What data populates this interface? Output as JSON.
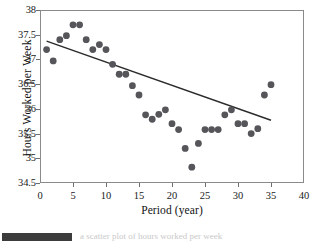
{
  "figure": {
    "caption_bar_label": "",
    "caption_text": "a scatter plot of hours worked per week"
  },
  "chart_data": {
    "type": "scatter",
    "title": "",
    "xlabel": "Period (year)",
    "ylabel": "Hours Worked per Week",
    "xlim": [
      0,
      40
    ],
    "ylim": [
      34.5,
      38
    ],
    "xticks": [
      0,
      5,
      10,
      15,
      20,
      25,
      30,
      35,
      40
    ],
    "xtick_labels": [
      "0",
      "5",
      "10",
      "15",
      "20",
      "25",
      "30",
      "35",
      "40"
    ],
    "yticks": [
      34.5,
      35,
      35.5,
      36,
      36.5,
      37,
      37.5,
      38
    ],
    "ytick_labels": [
      "34.5",
      "35",
      "35.5",
      "36",
      "36.5",
      "37",
      "37.5",
      "38"
    ],
    "grid": false,
    "legend": false,
    "marker_color": "#55555a",
    "marker_size": 3.4,
    "line_color": "#2b2b2b",
    "x": [
      1,
      2,
      3,
      4,
      5,
      6,
      7,
      8,
      9,
      10,
      11,
      12,
      13,
      14,
      15,
      16,
      17,
      18,
      19,
      20,
      21,
      22,
      23,
      24,
      25,
      26,
      27,
      28,
      29,
      30,
      31,
      32,
      33,
      34,
      35
    ],
    "y": [
      37.2,
      36.97,
      37.4,
      37.48,
      37.7,
      37.7,
      37.4,
      37.2,
      37.3,
      37.2,
      36.9,
      36.7,
      36.7,
      36.47,
      36.28,
      35.88,
      35.79,
      35.89,
      35.98,
      35.7,
      35.58,
      35.2,
      34.82,
      35.3,
      35.58,
      35.58,
      35.58,
      35.88,
      35.98,
      35.7,
      35.7,
      35.5,
      35.6,
      36.28,
      36.49
    ],
    "trendline": {
      "x": [
        1.0,
        35.0
      ],
      "y": [
        37.37,
        35.77
      ],
      "label": "least squares regression line"
    }
  }
}
